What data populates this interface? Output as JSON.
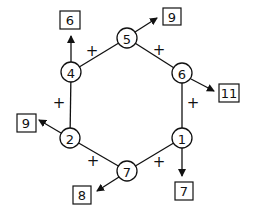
{
  "diagram": {
    "nodes": [
      {
        "id": "n5",
        "value": "5",
        "x": 127,
        "y": 38
      },
      {
        "id": "n6",
        "value": "6",
        "x": 182,
        "y": 73
      },
      {
        "id": "n1",
        "value": "1",
        "x": 182,
        "y": 138
      },
      {
        "id": "n7",
        "value": "7",
        "x": 127,
        "y": 171
      },
      {
        "id": "n2",
        "value": "2",
        "x": 70,
        "y": 138
      },
      {
        "id": "n4",
        "value": "4",
        "x": 71,
        "y": 72
      }
    ],
    "edges": [
      {
        "from": "n5",
        "to": "n6",
        "operator": "+"
      },
      {
        "from": "n6",
        "to": "n1",
        "operator": "+"
      },
      {
        "from": "n1",
        "to": "n7",
        "operator": "+"
      },
      {
        "from": "n7",
        "to": "n2",
        "operator": "+"
      },
      {
        "from": "n2",
        "to": "n4",
        "operator": "+"
      },
      {
        "from": "n4",
        "to": "n5",
        "operator": "+"
      }
    ],
    "boxes": [
      {
        "id": "b4",
        "from": "n4",
        "value": "6"
      },
      {
        "id": "b5",
        "from": "n5",
        "value": "9"
      },
      {
        "id": "b6",
        "from": "n6",
        "value": "11"
      },
      {
        "id": "b1",
        "from": "n1",
        "value": "7"
      },
      {
        "id": "b7",
        "from": "n7",
        "value": "8"
      },
      {
        "id": "b2",
        "from": "n2",
        "value": "9"
      }
    ],
    "plus_symbol": "+"
  }
}
